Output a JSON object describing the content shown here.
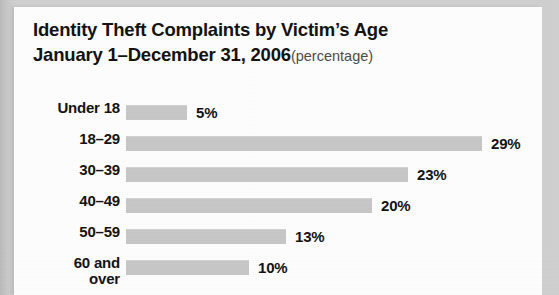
{
  "card": {
    "title_line1": "Identity Theft Complaints by Victim’s Age",
    "title_line2_main": "January 1–December 31, 2006",
    "title_line2_suffix": "(percentage)"
  },
  "colors": {
    "bar_fill": "#c6c6c6",
    "text": "#121212",
    "suffix_text": "#4a4a4a",
    "card_background": "#fdfdfd",
    "page_background": "#cacaca"
  },
  "chart_data": {
    "type": "bar",
    "orientation": "horizontal",
    "title": "Identity Theft Complaints by Victim’s Age January 1–December 31, 2006",
    "subtitle": "(percentage)",
    "xlabel": "",
    "ylabel": "",
    "unit": "percent",
    "grid": false,
    "legend": false,
    "xlim": [
      0,
      30
    ],
    "categories": [
      "Under 18",
      "18–29",
      "30–39",
      "40–49",
      "50–59",
      "60 and over"
    ],
    "values": [
      5,
      29,
      23,
      20,
      13,
      10
    ],
    "value_labels": [
      "5%",
      "29%",
      "23%",
      "20%",
      "13%",
      "10%"
    ],
    "rows": [
      {
        "label_line1": "Under 18",
        "label_line2": "",
        "value": 5,
        "value_label": "5%"
      },
      {
        "label_line1": "18–29",
        "label_line2": "",
        "value": 29,
        "value_label": "29%"
      },
      {
        "label_line1": "30–39",
        "label_line2": "",
        "value": 23,
        "value_label": "23%"
      },
      {
        "label_line1": "40–49",
        "label_line2": "",
        "value": 20,
        "value_label": "20%"
      },
      {
        "label_line1": "50–59",
        "label_line2": "",
        "value": 13,
        "value_label": "13%"
      },
      {
        "label_line1": "60 and",
        "label_line2": "over",
        "value": 10,
        "value_label": "10%"
      }
    ]
  }
}
